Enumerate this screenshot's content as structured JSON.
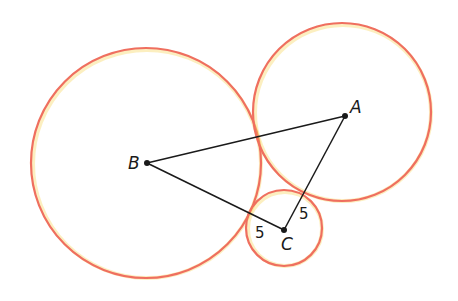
{
  "diagram": {
    "colors": {
      "circle_stroke": "#ef6f5f",
      "circle_glow": "#f7d24a",
      "line": "#1a1a1a"
    },
    "circles": [
      {
        "id": "B",
        "cx": 146,
        "cy": 163,
        "r": 115
      },
      {
        "id": "A",
        "cx": 342,
        "cy": 112,
        "r": 89
      },
      {
        "id": "C",
        "cx": 284,
        "cy": 228,
        "r": 38
      }
    ],
    "points": {
      "A": {
        "x": 345,
        "y": 116,
        "label": "A"
      },
      "B": {
        "x": 147,
        "y": 163,
        "label": "B"
      },
      "C": {
        "x": 284,
        "y": 230,
        "label": "C"
      }
    },
    "segment_labels": {
      "BC": "5",
      "AC": "5"
    }
  }
}
